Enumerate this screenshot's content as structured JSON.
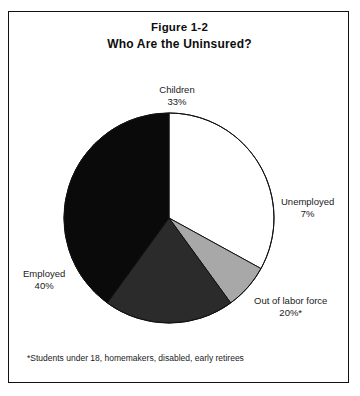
{
  "figure": {
    "title": "Figure 1-2",
    "subtitle": "Who Are the Uninsured?",
    "footnote": "*Students under 18, homemakers, disabled, early retirees"
  },
  "labels": {
    "children": {
      "name": "Children",
      "value": "33%"
    },
    "unemployed": {
      "name": "Unemployed",
      "value": "7%"
    },
    "out_of_labor_force": {
      "name": "Out of labor force",
      "value": "20%*"
    },
    "employed": {
      "name": "Employed",
      "value": "40%"
    }
  },
  "chart_data": {
    "type": "pie",
    "title": "Who Are the Uninsured?",
    "subtitle": "Figure 1-2",
    "categories": [
      "Children",
      "Unemployed",
      "Out of labor force",
      "Employed"
    ],
    "values": [
      33,
      7,
      20,
      40
    ],
    "value_labels": [
      "33%",
      "7%",
      "20%*",
      "40%"
    ],
    "colors": [
      "#ffffff",
      "#a8a8a8",
      "#2b2b2b",
      "#0a0a0a"
    ],
    "slice_edge_color": "#111111",
    "start_angle_deg": 0,
    "direction": "clockwise",
    "legend": "none",
    "labels_position": "outside-callout",
    "grid": false,
    "units": "percent",
    "total": 100,
    "footnote": "*Students under 18, homemakers, disabled, early retirees"
  }
}
